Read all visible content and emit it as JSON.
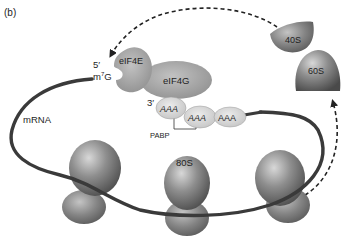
{
  "panel_label": "(b)",
  "labels": {
    "five_prime": "5′",
    "cap": "m",
    "cap_superscript": "7",
    "cap_base": "G",
    "three_prime": "3′",
    "mrna": "mRNA",
    "eif4e": "eIF4E",
    "eif4g": "eIF4G",
    "pabp": "PABP",
    "ribosome_80s": "80S",
    "subunit_40s": "40S",
    "subunit_60s": "60S"
  },
  "poly_a": {
    "pabp_1": [
      "A",
      "A",
      "A"
    ],
    "pabp_2": [
      "A",
      "A",
      "A"
    ],
    "pabp_3": [
      "A",
      "A",
      "A"
    ]
  },
  "colors": {
    "mrna_strand": "#3a3a3a",
    "protein_fill": "#a8a8a8",
    "pabp_fill": "#d6d6d6",
    "ribosome_fill": "#8a8a8a",
    "arrow": "#222222",
    "text": "#1e1e1e"
  }
}
